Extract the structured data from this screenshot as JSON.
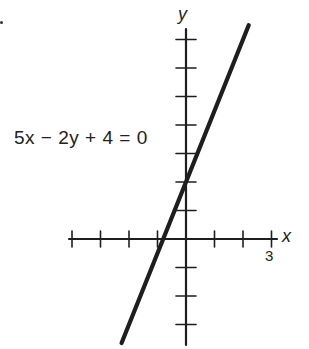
{
  "chart_data": {
    "type": "line",
    "title": "",
    "annotation": "5x − 2y + 4 = 0",
    "equation": "5x - 2y + 4 = 0",
    "slope": 2.5,
    "y_intercept": 2,
    "x_intercept": -0.8,
    "xlabel": "x",
    "ylabel": "y",
    "x_tick_label": "3",
    "x_ticks": [
      -4,
      -3,
      -2,
      -1,
      1,
      2,
      3
    ],
    "y_ticks": [
      -3,
      -2,
      -1,
      1,
      2,
      3,
      4,
      5,
      6,
      7
    ],
    "xlim": [
      -4.2,
      3.2
    ],
    "ylim": [
      -3.7,
      7.5
    ],
    "grid": false,
    "series": [
      {
        "name": "5x - 2y + 4 = 0",
        "x": [
          -2.26,
          2.2
        ],
        "y": [
          -3.65,
          7.5
        ]
      }
    ]
  },
  "labels": {
    "equation": "5x − 2y + 4 = 0",
    "x_axis": "x",
    "y_axis": "y",
    "x_tick_3": "3"
  }
}
